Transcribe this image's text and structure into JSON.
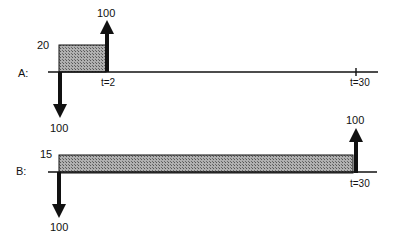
{
  "diagram": {
    "type": "cash-flow timeline",
    "colors": {
      "ink": "#111111",
      "fill": "#9a9a9a"
    },
    "rows": [
      {
        "id": "A",
        "label": "A:",
        "rect_label": "20",
        "inflow_label": "100",
        "outflow_label": "100",
        "tick_labels": [
          "t=2",
          "t=30"
        ]
      },
      {
        "id": "B",
        "label": "B:",
        "rect_label": "15",
        "inflow_label": "100",
        "outflow_label": "100",
        "tick_labels": [
          "t=30"
        ]
      }
    ]
  }
}
